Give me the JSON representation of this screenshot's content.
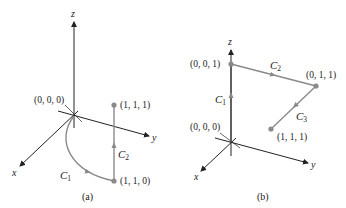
{
  "colors": {
    "axis": "#222222",
    "curve": "#8a8a8a",
    "point": "#8a8a8a",
    "text": "#1a1a1a"
  },
  "panels": [
    {
      "caption": "(a)",
      "axes": {
        "x": "x",
        "y": "y",
        "z": "z"
      },
      "points": [
        {
          "label": "(0, 0, 0)"
        },
        {
          "label": "(1, 1, 1)"
        },
        {
          "label": "(1, 1, 0)"
        }
      ],
      "curves": [
        {
          "name": "C",
          "sub": "1"
        },
        {
          "name": "C",
          "sub": "2"
        }
      ]
    },
    {
      "caption": "(b)",
      "axes": {
        "x": "x",
        "y": "y",
        "z": "z"
      },
      "points": [
        {
          "label": "(0, 0, 1)"
        },
        {
          "label": "(0, 1, 1)"
        },
        {
          "label": "(0, 0, 0)"
        },
        {
          "label": "(1, 1, 1)"
        }
      ],
      "curves": [
        {
          "name": "C",
          "sub": "1"
        },
        {
          "name": "C",
          "sub": "2"
        },
        {
          "name": "C",
          "sub": "3"
        }
      ]
    }
  ]
}
